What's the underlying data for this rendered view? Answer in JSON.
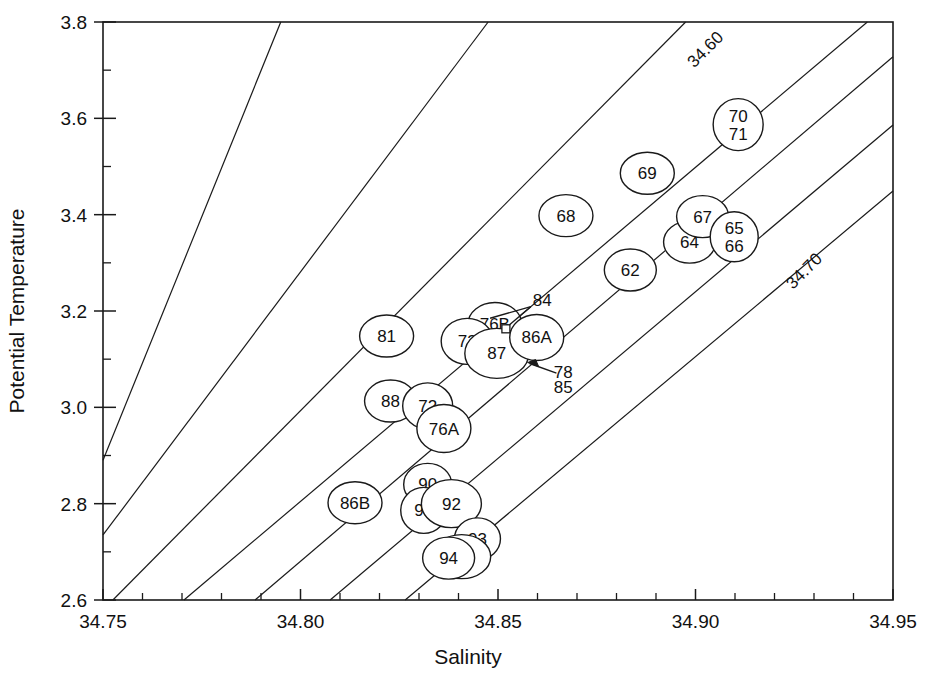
{
  "chart_data": {
    "type": "scatter",
    "title": "",
    "xlabel": "Salinity",
    "ylabel": "Potential Temperature",
    "xlim": [
      34.75,
      34.95
    ],
    "ylim": [
      2.6,
      3.8
    ],
    "grid": false,
    "legend": "none",
    "x_major_ticks": [
      "34.75",
      "34.80",
      "34.85",
      "34.90",
      "34.95"
    ],
    "x_major_values": [
      34.75,
      34.8,
      34.85,
      34.9,
      34.95
    ],
    "x_minor_step": 0.01,
    "y_major_ticks": [
      "2.6",
      "2.8",
      "3.0",
      "3.2",
      "3.4",
      "3.6",
      "3.8"
    ],
    "y_major_values": [
      2.6,
      2.8,
      3.0,
      3.2,
      3.4,
      3.6,
      3.8
    ],
    "y_minor_step": 0.1,
    "isopycnals": {
      "label_low": "34.60",
      "label_high": "34.70",
      "slope_per_salinity": 24.0,
      "lines": [
        {
          "x0": 34.75,
          "y0": 2.89,
          "x1": 34.795,
          "y1": 3.8
        },
        {
          "x0": 34.75,
          "y0": 2.735,
          "x1": 34.8475,
          "y1": 3.8
        },
        {
          "x0": 34.7525,
          "y0": 2.6,
          "x1": 34.8975,
          "y1": 3.8
        },
        {
          "x0": 34.7705,
          "y0": 2.6,
          "x1": 34.9435,
          "y1": 3.8
        },
        {
          "x0": 34.7885,
          "y0": 2.6,
          "x1": 34.95,
          "y1": 3.728
        },
        {
          "x0": 34.8075,
          "y0": 2.6,
          "x1": 34.95,
          "y1": 3.586
        },
        {
          "x0": 34.8265,
          "y0": 2.6,
          "x1": 34.95,
          "y1": 3.449
        }
      ],
      "label_low_anchor": {
        "x": 34.9035,
        "y": 3.735
      },
      "label_high_anchor": {
        "x": 34.9285,
        "y": 3.275
      }
    },
    "points": [
      {
        "label": "81",
        "x": 34.8218,
        "y": 3.148,
        "rx": 27,
        "ry": 21
      },
      {
        "label": "68",
        "x": 34.8672,
        "y": 3.398,
        "rx": 27,
        "ry": 21
      },
      {
        "label": "69",
        "x": 34.8878,
        "y": 3.486,
        "rx": 27,
        "ry": 21
      },
      {
        "label": "70\n71",
        "x": 34.9108,
        "y": 3.587,
        "rx": 25,
        "ry": 26
      },
      {
        "label": "62",
        "x": 34.8835,
        "y": 3.285,
        "rx": 26,
        "ry": 21
      },
      {
        "label": "64",
        "x": 34.8985,
        "y": 3.343,
        "rx": 26,
        "ry": 21
      },
      {
        "label": "67",
        "x": 34.9018,
        "y": 3.396,
        "rx": 26,
        "ry": 21
      },
      {
        "label": "65\n66",
        "x": 34.9098,
        "y": 3.354,
        "rx": 24,
        "ry": 25
      },
      {
        "label": "76B",
        "x": 34.8492,
        "y": 3.172,
        "rx": 27,
        "ry": 22
      },
      {
        "label": "73",
        "x": 34.8422,
        "y": 3.137,
        "rx": 26,
        "ry": 23
      },
      {
        "label": "87",
        "x": 34.8497,
        "y": 3.112,
        "rx": 32,
        "ry": 25
      },
      {
        "label": "86A",
        "x": 34.8598,
        "y": 3.145,
        "rx": 27,
        "ry": 23
      },
      {
        "label": "88",
        "x": 34.8228,
        "y": 3.013,
        "rx": 26,
        "ry": 21
      },
      {
        "label": "72",
        "x": 34.8322,
        "y": 3.003,
        "rx": 25,
        "ry": 23
      },
      {
        "label": "76A",
        "x": 34.8363,
        "y": 2.956,
        "rx": 27,
        "ry": 24
      },
      {
        "label": "86B",
        "x": 34.8138,
        "y": 2.802,
        "rx": 27,
        "ry": 21
      },
      {
        "label": "90",
        "x": 34.8322,
        "y": 2.84,
        "rx": 24,
        "ry": 21
      },
      {
        "label": "91",
        "x": 34.8312,
        "y": 2.786,
        "rx": 23,
        "ry": 23
      },
      {
        "label": "92",
        "x": 34.8382,
        "y": 2.8,
        "rx": 30,
        "ry": 24
      },
      {
        "label": "93",
        "x": 34.8448,
        "y": 2.727,
        "rx": 23,
        "ry": 21
      },
      {
        "label": "95",
        "x": 34.8408,
        "y": 2.69,
        "rx": 29,
        "ry": 22
      },
      {
        "label": "94",
        "x": 34.8375,
        "y": 2.687,
        "rx": 26,
        "ry": 21
      }
    ],
    "annotations": [
      {
        "name": "annotation-84",
        "text": "84",
        "text_x": 34.8612,
        "text_y": 3.223,
        "marker_x": 34.852,
        "marker_y": 3.163,
        "leader": [
          {
            "x1": 34.8583,
            "y1": 3.209,
            "x2": 34.8527,
            "y2": 3.17
          },
          {
            "x1": 34.8583,
            "y1": 3.209,
            "x2": 34.848,
            "y2": 3.185
          }
        ],
        "marker": "square"
      },
      {
        "name": "annotation-78",
        "text": "78",
        "text_x": 34.8665,
        "text_y": 3.074,
        "marker_x": 34.8575,
        "marker_y": 3.093,
        "leader": [
          {
            "x1": 34.8648,
            "y1": 3.071,
            "x2": 34.858,
            "y2": 3.091
          }
        ],
        "marker": "arrow"
      },
      {
        "name": "annotation-85",
        "text": "85",
        "text_x": 34.8665,
        "text_y": 3.043,
        "marker_x": null,
        "marker_y": null,
        "leader": [],
        "marker": "none"
      }
    ],
    "colors": {
      "axis": "#1a1a1a",
      "isoline": "#1a1a1a",
      "bubble_fill": "#ffffff",
      "bubble_stroke": "#1a1a1a",
      "text": "#111111",
      "background": "#ffffff"
    }
  }
}
